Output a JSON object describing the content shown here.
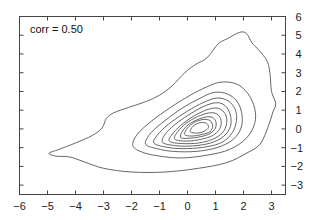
{
  "chart_data": {
    "type": "contour",
    "title": "",
    "xlabel": "",
    "ylabel": "",
    "annotation": "corr = 0.50",
    "xlim": [
      -6,
      3.5
    ],
    "ylim": [
      -3.5,
      6
    ],
    "x_ticks": [
      -6,
      -5,
      -4,
      -3,
      -2,
      -1,
      0,
      1,
      2,
      3
    ],
    "x_tick_labels": [
      "−6",
      "−5",
      "−4",
      "−3",
      "−2",
      "−1",
      "0",
      "1",
      "2",
      "3"
    ],
    "y_ticks": [
      -3,
      -2,
      -1,
      0,
      1,
      2,
      3,
      4,
      5,
      6
    ],
    "y_tick_labels": [
      "−3",
      "−2",
      "−1",
      "0",
      "1",
      "2",
      "3",
      "4",
      "5",
      "6"
    ],
    "y_axis_side": "right",
    "grid": false,
    "contours": [
      {
        "level": 1,
        "points": [
          [
            -4.95,
            -1.3
          ],
          [
            -4.6,
            -1.1
          ],
          [
            -4.0,
            -0.75
          ],
          [
            -3.4,
            -0.35
          ],
          [
            -3.05,
            0.05
          ],
          [
            -2.9,
            0.55
          ],
          [
            -2.65,
            0.85
          ],
          [
            -2.1,
            1.15
          ],
          [
            -1.5,
            1.45
          ],
          [
            -1.0,
            1.8
          ],
          [
            -0.55,
            2.3
          ],
          [
            -0.1,
            3.0
          ],
          [
            0.3,
            3.45
          ],
          [
            0.7,
            3.8
          ],
          [
            1.1,
            4.55
          ],
          [
            1.4,
            4.8
          ],
          [
            1.85,
            5.15
          ],
          [
            2.1,
            5.1
          ],
          [
            2.3,
            4.6
          ],
          [
            2.55,
            4.2
          ],
          [
            2.85,
            3.6
          ],
          [
            2.95,
            2.9
          ],
          [
            3.0,
            2.0
          ],
          [
            3.15,
            1.35
          ],
          [
            3.05,
            0.9
          ],
          [
            2.9,
            0.2
          ],
          [
            2.6,
            -0.8
          ],
          [
            2.1,
            -1.3
          ],
          [
            1.4,
            -1.8
          ],
          [
            0.4,
            -2.1
          ],
          [
            -0.8,
            -2.3
          ],
          [
            -2.0,
            -2.3
          ],
          [
            -3.0,
            -2.1
          ],
          [
            -3.7,
            -1.75
          ],
          [
            -4.2,
            -1.5
          ],
          [
            -4.7,
            -1.45
          ],
          [
            -4.95,
            -1.3
          ]
        ]
      },
      {
        "level": 2,
        "points": [
          [
            -1.95,
            -0.9
          ],
          [
            -1.8,
            -0.3
          ],
          [
            -1.3,
            0.4
          ],
          [
            -0.6,
            1.15
          ],
          [
            0.1,
            1.8
          ],
          [
            0.7,
            2.25
          ],
          [
            1.2,
            2.5
          ],
          [
            1.75,
            2.4
          ],
          [
            2.15,
            1.9
          ],
          [
            2.4,
            1.1
          ],
          [
            2.4,
            0.3
          ],
          [
            2.1,
            -0.5
          ],
          [
            1.5,
            -1.1
          ],
          [
            0.7,
            -1.4
          ],
          [
            -0.2,
            -1.55
          ],
          [
            -1.0,
            -1.45
          ],
          [
            -1.6,
            -1.25
          ],
          [
            -1.95,
            -0.9
          ]
        ]
      },
      {
        "level": 3,
        "points": [
          [
            -1.5,
            -0.8
          ],
          [
            -1.3,
            -0.2
          ],
          [
            -0.8,
            0.45
          ],
          [
            -0.2,
            1.1
          ],
          [
            0.4,
            1.6
          ],
          [
            0.95,
            1.95
          ],
          [
            1.45,
            1.85
          ],
          [
            1.8,
            1.4
          ],
          [
            1.95,
            0.7
          ],
          [
            1.9,
            0.0
          ],
          [
            1.6,
            -0.6
          ],
          [
            1.05,
            -1.0
          ],
          [
            0.3,
            -1.2
          ],
          [
            -0.5,
            -1.2
          ],
          [
            -1.1,
            -1.05
          ],
          [
            -1.5,
            -0.8
          ]
        ]
      },
      {
        "level": 4,
        "points": [
          [
            -1.2,
            -0.75
          ],
          [
            -1.0,
            -0.2
          ],
          [
            -0.55,
            0.4
          ],
          [
            0.0,
            0.95
          ],
          [
            0.55,
            1.4
          ],
          [
            1.05,
            1.65
          ],
          [
            1.45,
            1.5
          ],
          [
            1.7,
            1.05
          ],
          [
            1.75,
            0.45
          ],
          [
            1.6,
            -0.2
          ],
          [
            1.25,
            -0.7
          ],
          [
            0.7,
            -0.95
          ],
          [
            0.0,
            -1.05
          ],
          [
            -0.65,
            -1.0
          ],
          [
            -1.2,
            -0.75
          ]
        ]
      },
      {
        "level": 5,
        "points": [
          [
            -0.9,
            -0.7
          ],
          [
            -0.75,
            -0.2
          ],
          [
            -0.35,
            0.35
          ],
          [
            0.15,
            0.85
          ],
          [
            0.65,
            1.25
          ],
          [
            1.1,
            1.4
          ],
          [
            1.4,
            1.15
          ],
          [
            1.55,
            0.6
          ],
          [
            1.5,
            0.0
          ],
          [
            1.2,
            -0.5
          ],
          [
            0.7,
            -0.8
          ],
          [
            0.05,
            -0.92
          ],
          [
            -0.5,
            -0.88
          ],
          [
            -0.9,
            -0.7
          ]
        ]
      },
      {
        "level": 6,
        "points": [
          [
            -0.65,
            -0.65
          ],
          [
            -0.5,
            -0.2
          ],
          [
            -0.15,
            0.3
          ],
          [
            0.3,
            0.75
          ],
          [
            0.75,
            1.05
          ],
          [
            1.1,
            1.1
          ],
          [
            1.35,
            0.8
          ],
          [
            1.4,
            0.3
          ],
          [
            1.25,
            -0.2
          ],
          [
            0.9,
            -0.55
          ],
          [
            0.4,
            -0.75
          ],
          [
            -0.2,
            -0.78
          ],
          [
            -0.65,
            -0.65
          ]
        ]
      },
      {
        "level": 7,
        "points": [
          [
            -0.45,
            -0.55
          ],
          [
            -0.35,
            -0.15
          ],
          [
            -0.05,
            0.3
          ],
          [
            0.35,
            0.65
          ],
          [
            0.75,
            0.85
          ],
          [
            1.05,
            0.8
          ],
          [
            1.2,
            0.45
          ],
          [
            1.15,
            0.0
          ],
          [
            0.9,
            -0.35
          ],
          [
            0.5,
            -0.55
          ],
          [
            0.0,
            -0.65
          ],
          [
            -0.45,
            -0.55
          ]
        ]
      },
      {
        "level": 8,
        "points": [
          [
            -0.25,
            -0.45
          ],
          [
            -0.15,
            -0.05
          ],
          [
            0.1,
            0.3
          ],
          [
            0.45,
            0.55
          ],
          [
            0.8,
            0.65
          ],
          [
            1.0,
            0.45
          ],
          [
            1.0,
            0.05
          ],
          [
            0.8,
            -0.25
          ],
          [
            0.45,
            -0.42
          ],
          [
            0.05,
            -0.5
          ],
          [
            -0.25,
            -0.45
          ]
        ]
      },
      {
        "level": 9,
        "points": [
          [
            -0.1,
            -0.3
          ],
          [
            0.0,
            0.05
          ],
          [
            0.25,
            0.35
          ],
          [
            0.55,
            0.5
          ],
          [
            0.8,
            0.45
          ],
          [
            0.9,
            0.15
          ],
          [
            0.8,
            -0.15
          ],
          [
            0.5,
            -0.3
          ],
          [
            0.15,
            -0.38
          ],
          [
            -0.1,
            -0.3
          ]
        ]
      },
      {
        "level": 10,
        "points": [
          [
            0.1,
            -0.15
          ],
          [
            0.2,
            0.15
          ],
          [
            0.45,
            0.33
          ],
          [
            0.68,
            0.3
          ],
          [
            0.75,
            0.08
          ],
          [
            0.6,
            -0.12
          ],
          [
            0.35,
            -0.22
          ],
          [
            0.1,
            -0.15
          ]
        ]
      }
    ]
  }
}
